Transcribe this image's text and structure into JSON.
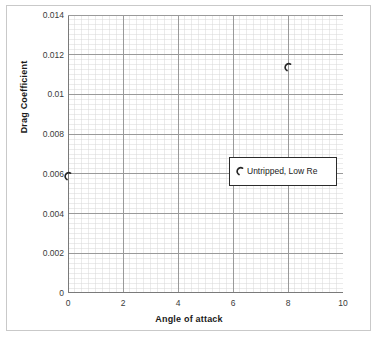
{
  "chart_data": {
    "type": "scatter",
    "title": "",
    "xlabel": "Angle of attack",
    "ylabel": "Drag Coefficient",
    "xlim": [
      0,
      10
    ],
    "ylim": [
      0,
      0.014
    ],
    "grid": true,
    "minor_grid": true,
    "legend_position": "inside-right",
    "x_ticks": [
      "0",
      "2",
      "4",
      "6",
      "8",
      "10"
    ],
    "x_tick_values": [
      0,
      2,
      4,
      6,
      8,
      10
    ],
    "y_ticks": [
      "0",
      "0.002",
      "0.004",
      "0.006",
      "0.008",
      "0.01",
      "0.012",
      "0.014"
    ],
    "y_tick_values": [
      0,
      0.002,
      0.004,
      0.006,
      0.008,
      0.01,
      0.012,
      0.014
    ],
    "x_minor_step": 0.25,
    "y_minor_step": 0.00025,
    "series": [
      {
        "name": "Untripped, Low Re",
        "marker": "open-arc",
        "color": "#262626",
        "points": [
          {
            "x": 0,
            "y": 0.006
          },
          {
            "x": 8,
            "y": 0.0115
          }
        ]
      }
    ]
  },
  "legend": {
    "entries": [
      {
        "label": "Untripped, Low Re",
        "marker": "open-arc"
      }
    ]
  },
  "colors": {
    "marker": "#262626",
    "major_grid": "#9a9a9a",
    "minor_grid": "#d8d8d8",
    "axis": "#7a7a7a",
    "frame": "#c9c9c9",
    "text": "#1a1a1a",
    "tick_text": "#3a3a3a",
    "background": "#ffffff"
  }
}
